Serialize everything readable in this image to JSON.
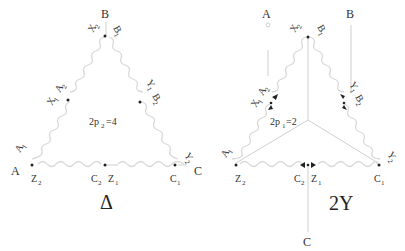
{
  "diagram": {
    "left": {
      "symbol": "Δ",
      "pole_label": "2p",
      "pole_sub": "2",
      "pole_value": "=4",
      "terminals": {
        "top": "B",
        "left": "A",
        "right": "C"
      },
      "nodes": {
        "top_left": {
          "main": "X",
          "sub": "2"
        },
        "top_right": {
          "main": "B",
          "sub": "1"
        },
        "left_mid_a": {
          "main": "A",
          "sub": "2"
        },
        "left_mid_x": {
          "main": "X",
          "sub": "1"
        },
        "right_mid_y": {
          "main": "Y",
          "sub": "1"
        },
        "right_mid_b": {
          "main": "B",
          "sub": "2"
        },
        "bottom_left_a": {
          "main": "A",
          "sub": "1"
        },
        "bottom_left_z": {
          "main": "Z",
          "sub": "2"
        },
        "bottom_mid_c": {
          "main": "C",
          "sub": "2"
        },
        "bottom_mid_z": {
          "main": "Z",
          "sub": "1"
        },
        "bottom_right_y": {
          "main": "Y",
          "sub": "2"
        },
        "bottom_right_c": {
          "main": "C",
          "sub": "1"
        }
      }
    },
    "right": {
      "symbol": "2Y",
      "pole_label": "2p",
      "pole_sub": "1",
      "pole_value": "=2",
      "terminals": {
        "top_a": "A",
        "top_b": "B",
        "bottom_c": "C"
      },
      "nodes": {
        "top_left": {
          "main": "X",
          "sub": "2"
        },
        "top_right": {
          "main": "B",
          "sub": "1"
        },
        "left_mid_a": {
          "main": "A",
          "sub": "2"
        },
        "left_mid_x": {
          "main": "X",
          "sub": "1"
        },
        "right_mid_y": {
          "main": "Y",
          "sub": "1"
        },
        "right_mid_b": {
          "main": "B",
          "sub": "2"
        },
        "bottom_left_a": {
          "main": "A",
          "sub": "1"
        },
        "bottom_left_z": {
          "main": "Z",
          "sub": "2"
        },
        "bottom_mid_c": {
          "main": "C",
          "sub": "2"
        },
        "bottom_mid_z": {
          "main": "Z",
          "sub": "1"
        },
        "bottom_right_y": {
          "main": "Y",
          "sub": "2"
        },
        "bottom_right_c": {
          "main": "C",
          "sub": "1"
        }
      }
    },
    "colors": {
      "winding": "#d9d9d9",
      "wire": "#cfcfcf",
      "text": "#333333",
      "dot": "#222222"
    }
  }
}
